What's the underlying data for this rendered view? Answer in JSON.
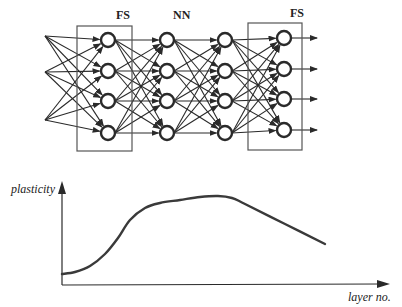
{
  "network": {
    "labels": {
      "fs_left": "FS",
      "nn": "NN",
      "fs_right": "FS"
    },
    "input_points": [
      [
        45,
        36
      ],
      [
        45,
        72
      ],
      [
        45,
        120
      ]
    ],
    "layers": [
      {
        "x": 108,
        "ys": [
          40,
          71,
          101,
          133
        ]
      },
      {
        "x": 167,
        "ys": [
          40,
          71,
          101,
          133
        ]
      },
      {
        "x": 225,
        "ys": [
          40,
          71,
          101,
          133
        ]
      },
      {
        "x": 284,
        "ys": [
          38,
          69,
          99,
          130
        ]
      }
    ],
    "boxes": [
      {
        "x": 77,
        "y": 26,
        "w": 55,
        "h": 125
      },
      {
        "x": 248,
        "y": 23,
        "w": 54,
        "h": 127
      }
    ],
    "output_arrow_end_x": 317,
    "colors": {
      "ink": "#2a2a2a"
    }
  },
  "chart_data": {
    "type": "line",
    "title": "",
    "xlabel": "layer no.",
    "ylabel": "plasticity",
    "grid": false,
    "legend": null,
    "x": [
      0,
      0.1,
      0.2,
      0.3,
      0.4,
      0.5,
      0.6,
      0.7,
      0.8,
      0.9,
      1.0
    ],
    "y": [
      0.1,
      0.15,
      0.4,
      0.65,
      0.78,
      0.82,
      0.85,
      0.85,
      0.72,
      0.6,
      0.48
    ],
    "xlim": [
      0,
      1.2
    ],
    "ylim": [
      0,
      1.1
    ],
    "series": [
      {
        "name": "plasticity",
        "points_px": [
          [
            62,
            274
          ],
          [
            75,
            272
          ],
          [
            90,
            266
          ],
          [
            105,
            254
          ],
          [
            118,
            238
          ],
          [
            130,
            220
          ],
          [
            145,
            208
          ],
          [
            160,
            203
          ],
          [
            180,
            200
          ],
          [
            200,
            197
          ],
          [
            218,
            196
          ],
          [
            232,
            198
          ],
          [
            245,
            204
          ],
          [
            285,
            224
          ],
          [
            325,
            244
          ]
        ]
      }
    ]
  }
}
